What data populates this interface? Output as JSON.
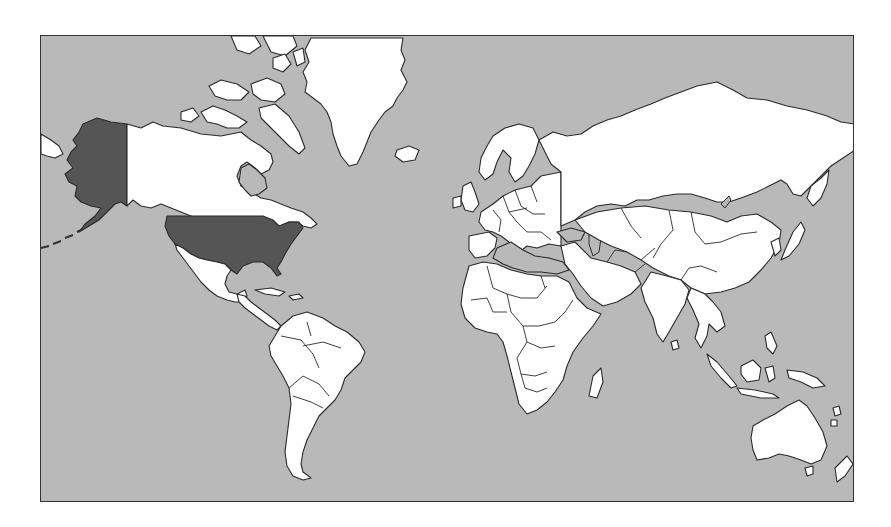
{
  "map": {
    "type": "world choropleth",
    "projection": "Mercator",
    "colors": {
      "ocean": "#b9b9b9",
      "land": "#ffffff",
      "highlight": "#555555",
      "outline": "#2a2a2a",
      "frame": "#333333",
      "page_background": "#ffffff"
    },
    "highlighted_regions": [
      {
        "name": "United States (contiguous)",
        "fill": "#555555"
      },
      {
        "name": "Alaska",
        "fill": "#555555"
      }
    ],
    "legend": null,
    "title": null,
    "labels": []
  }
}
